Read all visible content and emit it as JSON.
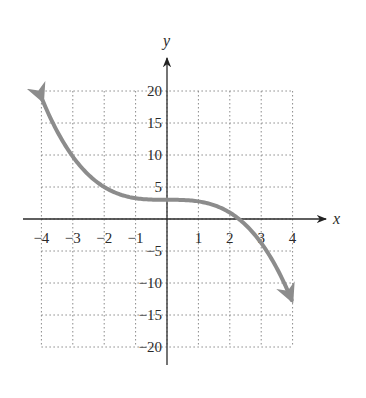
{
  "chart_data": {
    "type": "line",
    "title": "",
    "xlabel": "x",
    "ylabel": "y",
    "xlim": [
      -4,
      4
    ],
    "ylim": [
      -20,
      20
    ],
    "grid": true,
    "grid_style": "dotted",
    "x_ticks": [
      -4,
      -3,
      -2,
      -1,
      1,
      2,
      3,
      4
    ],
    "x_tick_labels": [
      "−4",
      "−3",
      "−2",
      "−1",
      "1",
      "2",
      "3",
      "4"
    ],
    "y_ticks": [
      20,
      15,
      10,
      5,
      -5,
      -10,
      -15,
      -20
    ],
    "y_tick_labels": [
      "20",
      "15",
      "10",
      "5",
      "−5",
      "−10",
      "−15",
      "−20"
    ],
    "series": [
      {
        "name": "f(x)",
        "color": "#8c8c8c",
        "arrows_at_ends": true,
        "x": [
          -4,
          -3,
          -2,
          -1,
          0,
          1,
          2,
          2.3,
          3,
          4
        ],
        "y": [
          19,
          9.75,
          5,
          3.25,
          3,
          2.75,
          1,
          0,
          -3.75,
          -13
        ]
      }
    ],
    "colors": {
      "axis": "#2a2a2a",
      "grid": "#8a8a8a",
      "curve": "#8c8c8c"
    }
  }
}
